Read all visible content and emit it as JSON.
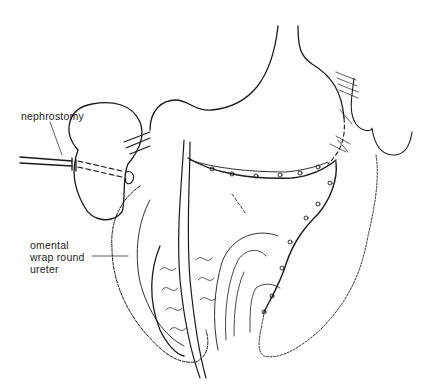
{
  "figure": {
    "type": "surgical illustration",
    "stroke_color": "#1a1a1a",
    "background": "#ffffff"
  },
  "labels": {
    "nephrostomy": "nephrostomy",
    "omental_line1": "omental",
    "omental_line2": "wrap round",
    "omental_line3": "ureter"
  }
}
